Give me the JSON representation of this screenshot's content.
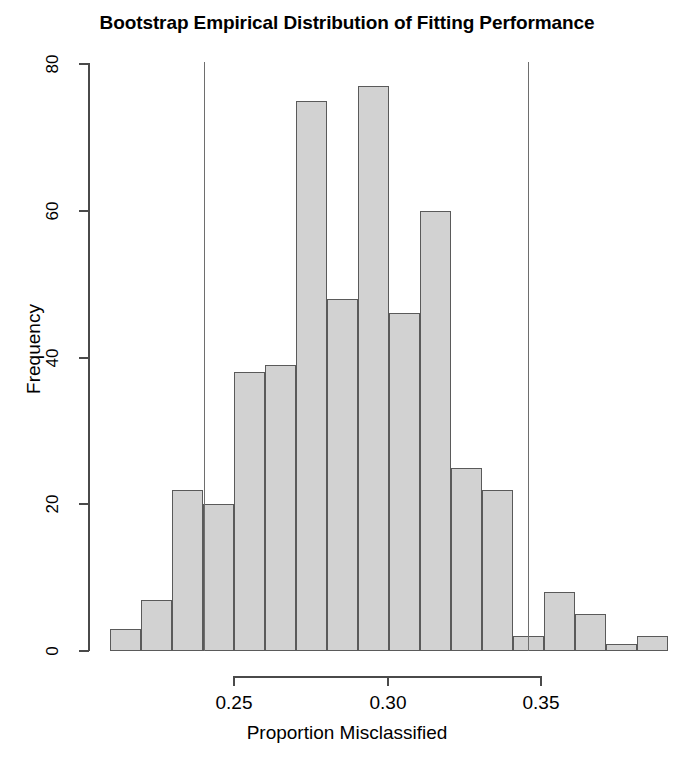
{
  "chart_data": {
    "type": "bar",
    "subtype": "histogram",
    "title": "Bootstrap Empirical Distribution of Fitting Performance",
    "xlabel": "Proportion Misclassified",
    "ylabel": "Frequency",
    "xlim": [
      0.2175,
      0.3675
    ],
    "ylim": [
      0,
      80
    ],
    "bin_width": 0.01,
    "grid": false,
    "legend": null,
    "bin_starts": [
      0.2175,
      0.2275,
      0.2375,
      0.2475,
      0.2575,
      0.2675,
      0.2775,
      0.2875,
      0.2975,
      0.3075,
      0.3175,
      0.3275,
      0.3375,
      0.3475
    ],
    "categories": [
      "0.2175-0.2275",
      "0.2275-0.2375",
      "0.2375-0.2475",
      "0.2475-0.2575",
      "0.2575-0.2675",
      "0.2675-0.2775",
      "0.2775-0.2875",
      "0.2875-0.2975",
      "0.2975-0.3075",
      "0.3075-0.3175",
      "0.3175-0.3275",
      "0.3275-0.3375",
      "0.3375-0.3475",
      "0.3475-0.3575"
    ],
    "values": [
      3,
      7,
      22,
      20,
      38,
      39,
      75,
      48,
      77,
      46,
      60,
      25,
      22,
      2
    ],
    "bars": [
      {
        "x0": 110,
        "x1": 141,
        "value": 3
      },
      {
        "x0": 141,
        "x1": 172,
        "value": 7
      },
      {
        "x0": 172,
        "x1": 203,
        "value": 22
      },
      {
        "x0": 203,
        "x1": 234,
        "value": 20
      },
      {
        "x0": 234,
        "x1": 265,
        "value": 38
      },
      {
        "x0": 265,
        "x1": 296,
        "value": 39
      },
      {
        "x0": 296,
        "x1": 327,
        "value": 75
      },
      {
        "x0": 327,
        "x1": 358,
        "value": 48
      },
      {
        "x0": 358,
        "x1": 389,
        "value": 77
      },
      {
        "x0": 389,
        "x1": 420,
        "value": 46
      },
      {
        "x0": 420,
        "x1": 451,
        "value": 60
      },
      {
        "x0": 451,
        "x1": 482,
        "value": 25
      },
      {
        "x0": 482,
        "x1": 513,
        "value": 22
      },
      {
        "x0": 513,
        "x1": 544,
        "value": 2
      },
      {
        "x0": 544,
        "x1": 575,
        "value": 8
      },
      {
        "x0": 575,
        "x1": 606,
        "value": 5
      },
      {
        "x0": 606,
        "x1": 637,
        "value": 1
      },
      {
        "x0": 637,
        "x1": 668,
        "value": 2
      }
    ],
    "reference_lines": [
      {
        "name": "lower-confidence-bound",
        "x_pixel": 204,
        "value": 0.235
      },
      {
        "name": "upper-confidence-bound",
        "x_pixel": 528,
        "value": 0.3405
      }
    ],
    "y_ticks": [
      {
        "label": "0",
        "value": 0
      },
      {
        "label": "20",
        "value": 20
      },
      {
        "label": "40",
        "value": 40
      },
      {
        "label": "60",
        "value": 60
      },
      {
        "label": "80",
        "value": 80
      }
    ],
    "x_ticks": [
      {
        "label": "0.25",
        "value": 0.25,
        "x_pixel": 234
      },
      {
        "label": "0.30",
        "value": 0.3,
        "x_pixel": 388
      },
      {
        "label": "0.35",
        "value": 0.35,
        "x_pixel": 541
      }
    ],
    "colors": {
      "bar_fill": "#d2d2d2",
      "bar_border": "#5a5a5a",
      "axis": "#4a4a4a",
      "reference_line": "#6e6e6e",
      "background": "#ffffff",
      "text": "#000000"
    }
  }
}
